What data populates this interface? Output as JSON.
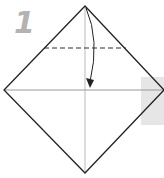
{
  "diagram": {
    "type": "origami-step",
    "step_number": "1",
    "colors": {
      "outline": "#222222",
      "crease": "#bbbbbb",
      "fold_line": "#333333",
      "step_number": "#b3b3b3",
      "background_band": "#e6e6e6"
    },
    "elements": [
      {
        "name": "paper-square",
        "shape": "diamond"
      },
      {
        "name": "horizontal-crease",
        "style": "thin gray"
      },
      {
        "name": "vertical-crease",
        "style": "thin gray"
      },
      {
        "name": "valley-fold-line",
        "style": "dashed"
      },
      {
        "name": "fold-arrow",
        "direction": "top corner down to center"
      }
    ]
  }
}
